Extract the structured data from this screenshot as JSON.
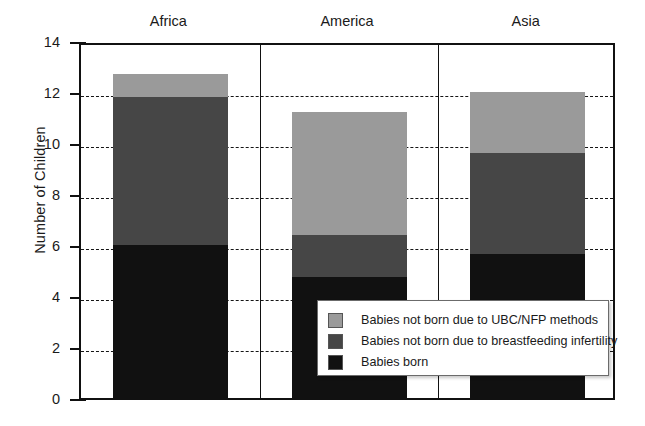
{
  "chart_data": {
    "type": "bar",
    "subtype": "stacked-bar",
    "title": "",
    "xlabel": "",
    "ylabel": "Number of Children",
    "categories": [
      "Africa",
      "America",
      "Asia"
    ],
    "ylim": [
      0,
      14
    ],
    "yticks": [
      0,
      2,
      4,
      6,
      8,
      10,
      12,
      14
    ],
    "ytick_labels": [
      "0",
      "2",
      "4",
      "6",
      "8",
      "10",
      "12",
      "14"
    ],
    "grid": "horizontal-dashed",
    "legend_position": "inside-bottom-right",
    "series": [
      {
        "name": "Babies born",
        "color": "#111111",
        "values": [
          6.0,
          4.75,
          5.65
        ]
      },
      {
        "name": "Babies not born due to breastfeeding infertility",
        "color": "#464646",
        "values": [
          5.8,
          1.65,
          3.95
        ]
      },
      {
        "name": "Babies not born due to UBC/NFP methods",
        "color": "#9a9a9a",
        "values": [
          0.9,
          4.8,
          2.4
        ]
      }
    ],
    "stack_order_bottom_to_top": [
      "Babies born",
      "Babies not born due to breastfeeding infertility",
      "Babies not born due to UBC/NFP methods"
    ],
    "totals": [
      12.7,
      11.2,
      12.0
    ],
    "annotations": []
  },
  "legend": {
    "entries": [
      {
        "label": "Babies not born due to UBC/NFP methods",
        "color": "#9a9a9a"
      },
      {
        "label": "Babies not born due to breastfeeding infertility",
        "color": "#464646"
      },
      {
        "label": "Babies born",
        "color": "#111111"
      }
    ]
  },
  "colors": {
    "light_gray": "#9a9a9a",
    "dark_gray": "#464646",
    "black": "#111111",
    "axis": "#111111",
    "background": "#ffffff"
  }
}
